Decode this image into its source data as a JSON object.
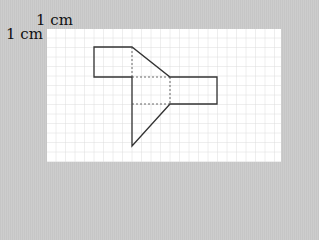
{
  "labels": {
    "top": "1 cm",
    "left": "1 cm"
  },
  "grid": {
    "cell_px": 9.5,
    "line_color": "#d4d4d4"
  },
  "shape": {
    "stroke": "#333333",
    "description": "Net of a 3D prism with dashed fold lines"
  }
}
